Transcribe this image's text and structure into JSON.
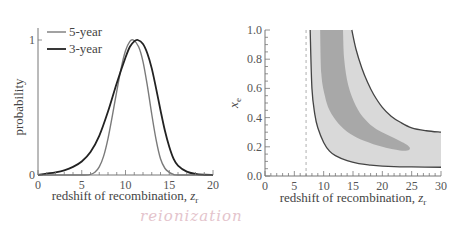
{
  "chart_data": [
    {
      "type": "line",
      "title": "",
      "xlabel": "redshift of recombination, z_r",
      "xlabel_main": "redshift of recombination, ",
      "xlabel_var": "z",
      "xlabel_sub": "r",
      "ylabel": "probability",
      "xlim": [
        0,
        20
      ],
      "ylim": [
        0,
        1
      ],
      "xticks": [
        "0",
        "5",
        "10",
        "15",
        "20"
      ],
      "yticks": [
        "0",
        "1"
      ],
      "grid": false,
      "legend_position": "upper left",
      "series": [
        {
          "name": "5-year",
          "color": "#7a7a7a",
          "x": [
            0,
            5,
            6,
            6.5,
            7,
            7.5,
            8,
            8.5,
            9,
            9.5,
            10,
            10.5,
            10.9,
            11.5,
            12,
            12.5,
            13,
            13.5,
            14,
            14.5,
            15,
            15.5,
            16,
            20
          ],
          "y": [
            0,
            0,
            0.005,
            0.02,
            0.06,
            0.14,
            0.27,
            0.44,
            0.62,
            0.79,
            0.92,
            0.99,
            1.0,
            0.95,
            0.84,
            0.66,
            0.45,
            0.26,
            0.12,
            0.05,
            0.02,
            0.005,
            0,
            0
          ]
        },
        {
          "name": "3-year",
          "color": "#222222",
          "x": [
            0,
            1,
            2,
            3,
            4,
            5,
            6,
            7,
            8,
            9,
            10,
            10.5,
            11,
            11.4,
            12,
            12.5,
            13,
            13.5,
            14,
            14.5,
            15,
            15.5,
            16,
            17,
            18,
            19,
            20
          ],
          "y": [
            0,
            0.01,
            0.02,
            0.035,
            0.06,
            0.1,
            0.17,
            0.29,
            0.47,
            0.68,
            0.87,
            0.95,
            0.99,
            1.0,
            0.97,
            0.9,
            0.79,
            0.64,
            0.48,
            0.33,
            0.21,
            0.12,
            0.07,
            0.025,
            0.008,
            0.002,
            0
          ]
        }
      ]
    },
    {
      "type": "area",
      "title": "",
      "xlabel": "redshift of recombination, z_r",
      "xlabel_main": "redshift of recombination, ",
      "xlabel_var": "z",
      "xlabel_sub": "r",
      "ylabel": "x_e",
      "ylabel_var": "x",
      "ylabel_sub": "e",
      "xlim": [
        0,
        30
      ],
      "ylim": [
        0,
        1.0
      ],
      "xticks": [
        "0",
        "5",
        "10",
        "15",
        "20",
        "25",
        "30"
      ],
      "yticks": [
        "0.0",
        "0.2",
        "0.4",
        "0.6",
        "0.8",
        "1.0"
      ],
      "grid": false,
      "annotations": [
        {
          "type": "vertical-dashed-line",
          "x": 7
        }
      ],
      "series": [
        {
          "name": "95% confidence region",
          "color": "#d9d9d9",
          "outline_color": "#444444",
          "lower_boundary": {
            "x": [
              7.7,
              8,
              8.5,
              9,
              10,
              11,
              12,
              14,
              16,
              18,
              20,
              22,
              25,
              30
            ],
            "y": [
              1.0,
              0.6,
              0.42,
              0.33,
              0.23,
              0.17,
              0.14,
              0.105,
              0.085,
              0.075,
              0.068,
              0.064,
              0.062,
              0.06
            ]
          },
          "upper_boundary": {
            "x": [
              14.8,
              15.5,
              16.5,
              17.5,
              18.5,
              20,
              21.5,
              23,
              25,
              27.5,
              30
            ],
            "y": [
              1.0,
              0.87,
              0.74,
              0.64,
              0.56,
              0.47,
              0.41,
              0.37,
              0.33,
              0.31,
              0.3
            ]
          }
        },
        {
          "name": "68% confidence region",
          "color": "#a8a8a8",
          "outline": {
            "x": [
              9.4,
              9.6,
              10.2,
              11,
              12.5,
              14.5,
              17,
              20,
              23,
              24.6,
              24.3,
              22,
              19,
              17,
              15.5,
              14.2,
              13.5,
              13.3
            ],
            "y": [
              1.0,
              0.7,
              0.55,
              0.45,
              0.36,
              0.29,
              0.24,
              0.2,
              0.175,
              0.18,
              0.21,
              0.26,
              0.32,
              0.39,
              0.48,
              0.62,
              0.8,
              1.0
            ]
          }
        }
      ]
    }
  ],
  "legend": [
    {
      "label": "5-year",
      "color": "#7a7a7a"
    },
    {
      "label": "3-year",
      "color": "#222222"
    }
  ],
  "handwritten_note": "reionization",
  "colors": {
    "axis": "#777777",
    "outer_region": "#d9d9d9",
    "inner_region": "#a8a8a8",
    "contour_line": "#444444",
    "annotation": "#e4c4cc"
  }
}
